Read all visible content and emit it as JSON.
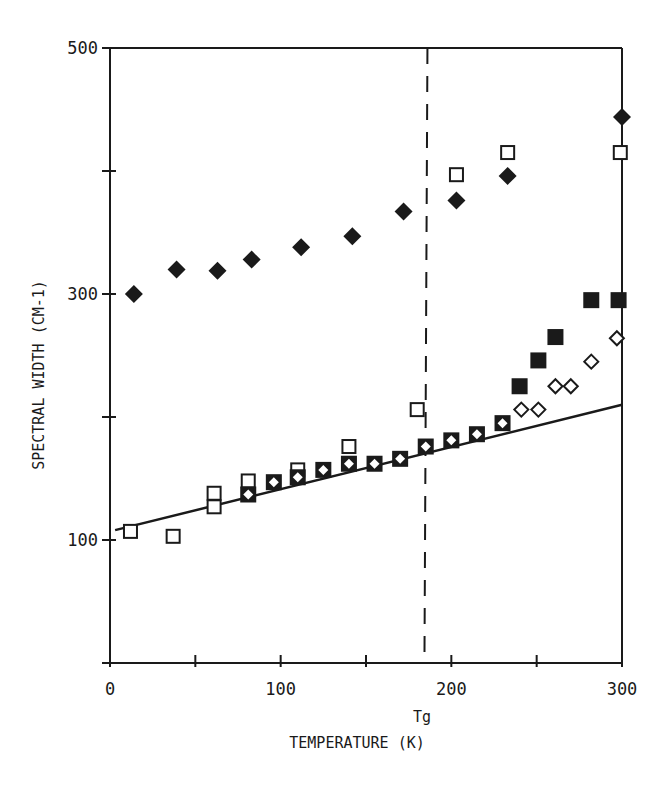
{
  "chart_data": {
    "type": "scatter",
    "title": "",
    "xlabel": "TEMPERATURE (K)",
    "ylabel": "SPECTRAL WIDTH (CM-1)",
    "xlim": [
      0,
      300
    ],
    "ylim": [
      0,
      500
    ],
    "x_ticks": [
      0,
      50,
      100,
      150,
      200,
      250,
      300
    ],
    "x_tick_labels": [
      "0",
      "",
      "100",
      "",
      "200",
      "",
      "300"
    ],
    "y_ticks": [
      0,
      100,
      200,
      300,
      400,
      500
    ],
    "y_tick_labels": [
      "",
      "100",
      "",
      "300",
      "",
      "500"
    ],
    "grid": false,
    "legend": "none",
    "annotations": [
      {
        "text": "Tg",
        "x": 186,
        "type": "vertical-dashed-line"
      }
    ],
    "series": [
      {
        "name": "filled diamonds",
        "marker": "diamond-filled",
        "points": [
          [
            14,
            300
          ],
          [
            39,
            320
          ],
          [
            63,
            319
          ],
          [
            83,
            328
          ],
          [
            112,
            338
          ],
          [
            142,
            347
          ],
          [
            172,
            367
          ],
          [
            203,
            376
          ],
          [
            233,
            396
          ],
          [
            300,
            444
          ]
        ]
      },
      {
        "name": "open squares",
        "marker": "square-open",
        "points": [
          [
            12,
            107
          ],
          [
            37,
            103
          ],
          [
            61,
            138
          ],
          [
            61,
            127
          ],
          [
            81,
            148
          ],
          [
            110,
            157
          ],
          [
            140,
            176
          ],
          [
            180,
            206
          ],
          [
            203,
            397
          ],
          [
            233,
            415
          ],
          [
            299,
            415
          ]
        ]
      },
      {
        "name": "filled squares with open diamonds",
        "marker": "square-filled-diamond-open",
        "points": [
          [
            81,
            137
          ],
          [
            96,
            147
          ],
          [
            110,
            151
          ],
          [
            125,
            157
          ],
          [
            140,
            162
          ],
          [
            155,
            162
          ],
          [
            170,
            166
          ],
          [
            185,
            176
          ],
          [
            200,
            181
          ],
          [
            215,
            186
          ],
          [
            230,
            195
          ]
        ]
      },
      {
        "name": "filled squares",
        "marker": "square-filled",
        "points": [
          [
            240,
            225
          ],
          [
            251,
            246
          ],
          [
            261,
            265
          ],
          [
            282,
            295
          ],
          [
            298,
            295
          ]
        ]
      },
      {
        "name": "open diamonds",
        "marker": "diamond-open",
        "points": [
          [
            241,
            206
          ],
          [
            251,
            206
          ],
          [
            261,
            225
          ],
          [
            270,
            225
          ],
          [
            282,
            245
          ],
          [
            297,
            264
          ]
        ]
      },
      {
        "name": "fit line",
        "type": "line",
        "points": [
          [
            3,
            108
          ],
          [
            300,
            210
          ]
        ]
      }
    ]
  }
}
